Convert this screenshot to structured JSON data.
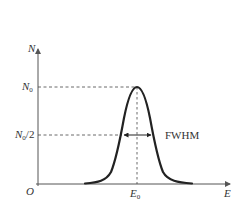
{
  "diagram": {
    "type": "gaussian-peak",
    "axes": {
      "y_label": "N",
      "x_label": "E",
      "origin_label": "O"
    },
    "y_ticks": [
      {
        "label_main": "N",
        "label_sub": "0",
        "label_suffix": "",
        "meaning": "peak height"
      },
      {
        "label_main": "N",
        "label_sub": "0",
        "label_suffix": "/2",
        "meaning": "half maximum"
      }
    ],
    "x_ticks": [
      {
        "label_main": "E",
        "label_sub": "0",
        "meaning": "peak center"
      }
    ],
    "annotation": "FWHM",
    "colors": {
      "axis": "#555555",
      "curve": "#222222",
      "dashed": "#444444",
      "text": "#333333"
    }
  }
}
